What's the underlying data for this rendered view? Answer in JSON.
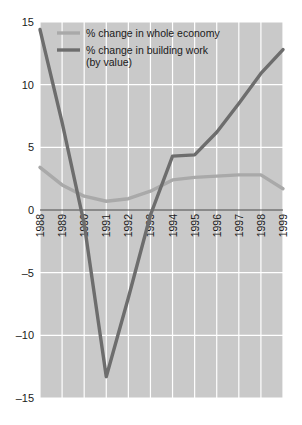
{
  "chart_data": {
    "type": "line",
    "title": "",
    "subtitle": "",
    "xlabel": "",
    "ylabel": "",
    "categories": [
      "1988",
      "1989",
      "1990",
      "1991",
      "1992",
      "1993",
      "1994",
      "1995",
      "1996",
      "1997",
      "1998",
      "1999"
    ],
    "x": [
      1988,
      1989,
      1990,
      1991,
      1992,
      1993,
      1994,
      1995,
      1996,
      1997,
      1998,
      1999
    ],
    "xlim": [
      1988,
      1999
    ],
    "ylim": [
      -15,
      15
    ],
    "yticks": [
      15,
      10,
      5,
      0,
      -5,
      -10,
      -15
    ],
    "ytick_labels": [
      "15",
      "10",
      "5",
      "0",
      "–5",
      "–10",
      "–15"
    ],
    "grid": true,
    "grid_color": "#ffffff",
    "plot_background": "#c9c9c9",
    "legend_position": "top-left-inside",
    "series": [
      {
        "name": "% change in whole economy",
        "color": "#a9a9a9",
        "values": [
          3.4,
          2.0,
          1.1,
          0.7,
          0.9,
          1.5,
          2.4,
          2.6,
          2.7,
          2.8,
          2.8,
          1.7
        ]
      },
      {
        "name": "% change in building work (by value)",
        "color": "#6d6d6d",
        "values": [
          14.4,
          7.0,
          -1.1,
          -13.3,
          -7.0,
          -0.4,
          4.3,
          4.4,
          6.2,
          8.5,
          10.9,
          12.8
        ]
      }
    ]
  },
  "legend": {
    "items": [
      {
        "label": "% change in whole economy",
        "label_line2": "",
        "color": "#a9a9a9"
      },
      {
        "label": "% change in building work",
        "label_line2": "(by value)",
        "color": "#6d6d6d"
      }
    ]
  },
  "axes": {
    "y_tick_labels": [
      "15",
      "10",
      "5",
      "0",
      "–5",
      "–10",
      "–15"
    ],
    "x_tick_labels": [
      "1988",
      "1989",
      "1990",
      "1991",
      "1992",
      "1993",
      "1994",
      "1995",
      "1996",
      "1997",
      "1998",
      "1999"
    ]
  }
}
